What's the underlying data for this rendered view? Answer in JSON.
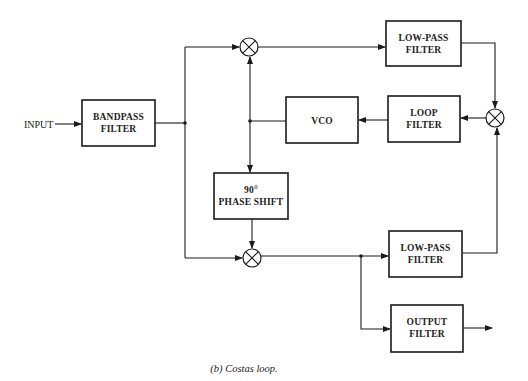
{
  "diagram": {
    "input_label": "INPUT",
    "blocks": {
      "bandpass": [
        "BANDPASS",
        "FILTER"
      ],
      "lpf_top": [
        "LOW-PASS",
        "FILTER"
      ],
      "loop_filter": [
        "LOOP",
        "FILTER"
      ],
      "vco": [
        "VCO"
      ],
      "phase_shift": [
        "90°",
        "PHASE SHIFT"
      ],
      "lpf_bottom": [
        "LOW-PASS",
        "FILTER"
      ],
      "output_filter": [
        "OUTPUT",
        "FILTER"
      ]
    },
    "mixers": [
      "top-mixer",
      "right-mixer",
      "bottom-mixer"
    ],
    "caption": "(b)  Costas loop."
  },
  "colors": {
    "line": "#1a1a1a",
    "background": "#ffffff"
  }
}
